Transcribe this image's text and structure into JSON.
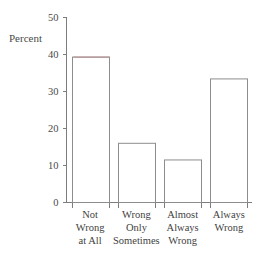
{
  "chart_data": {
    "type": "bar",
    "title": "",
    "subtitle": "",
    "xlabel": "",
    "ylabel": "Percent",
    "ylim": [
      0,
      50
    ],
    "yticks": [
      0,
      10,
      20,
      30,
      40,
      50
    ],
    "ytick_labels": [
      "0",
      "10",
      "20",
      "30",
      "40",
      "50"
    ],
    "grid": false,
    "legend": false,
    "legend_position": "none",
    "categories": [
      "Not Wrong at All",
      "Wrong Only Sometimes",
      "Almost Always Wrong",
      "Always Wrong"
    ],
    "category_lines": [
      [
        "Not",
        "Wrong",
        "at All"
      ],
      [
        "Wrong",
        "Only",
        "Sometimes"
      ],
      [
        "Almost",
        "Always",
        "Wrong"
      ],
      [
        "Always",
        "Wrong"
      ]
    ],
    "values": [
      39.3,
      16.0,
      11.5,
      33.4
    ],
    "value_labels": [
      "39.3",
      "16.0",
      "11.5",
      "33.4"
    ],
    "annotations": []
  },
  "style": {
    "bar_fill": "#ffffff",
    "bar_stroke": "#8d8d8d",
    "axis_color": "#7d7d7d",
    "text_color": "#4a4a4a",
    "background": "#ffffff",
    "highlight_color": "#b98d8d"
  },
  "axis": {
    "y_label": "Percent"
  }
}
